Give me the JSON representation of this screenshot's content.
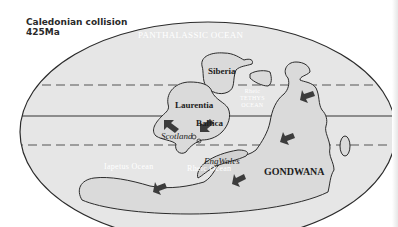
{
  "figure": {
    "title_line1": "Caledonian collision",
    "title_line2": "425Ma"
  },
  "labels": {
    "panthalassic": "PANTHALASSIC OCEAN",
    "siberia": "Siberia",
    "laurentia": "Laurentia",
    "baltica": "Baltica",
    "scotland": "Scotland",
    "engwales": "EngWales",
    "gondwana": "GONDWANA",
    "iapetus": "Iapetus Ocean",
    "rheic": "Rheic Ocean",
    "tethys_line1": "Rheic",
    "tethys_line2": "TETHYS",
    "tethys_line3": "OCEAN"
  },
  "colors": {
    "ocean": "#e4e4e4",
    "land": "#dcdcdc",
    "outline": "#2b2b2b",
    "arrow": "#3c3c3c"
  }
}
